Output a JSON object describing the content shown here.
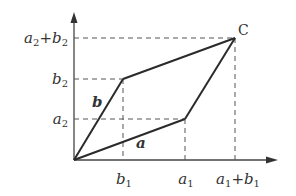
{
  "diagram": {
    "colors": {
      "line": "#2a2a2a",
      "dash": "#555555",
      "text": "#333333"
    },
    "axes": {
      "x_arrow": true,
      "y_arrow": true
    },
    "points": {
      "O": {
        "x": 74,
        "y": 160
      },
      "A": {
        "x": 185,
        "y": 119
      },
      "B": {
        "x": 123,
        "y": 79
      },
      "C": {
        "x": 235,
        "y": 38
      }
    },
    "vectors": [
      {
        "name": "a",
        "label": "a",
        "from": "O",
        "to": "A"
      },
      {
        "name": "b",
        "label": "b",
        "from": "O",
        "to": "B"
      }
    ],
    "point_label_C": "C",
    "y_ticks": [
      {
        "base": "a",
        "sub": "2",
        "plus": "+",
        "base2": "b",
        "sub2": "2",
        "y": 38
      },
      {
        "base": "b",
        "sub": "2",
        "y": 79
      },
      {
        "base": "a",
        "sub": "2",
        "y": 119
      }
    ],
    "x_ticks": [
      {
        "base": "b",
        "sub": "1",
        "x": 123
      },
      {
        "base": "a",
        "sub": "1",
        "x": 185
      },
      {
        "base": "a",
        "sub": "1",
        "plus": "+",
        "base2": "b",
        "sub2": "1",
        "x": 235
      }
    ]
  }
}
